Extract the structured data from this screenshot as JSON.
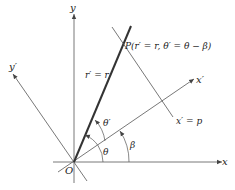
{
  "diagram": {
    "labels": {
      "x_axis": "x",
      "y_axis": "y",
      "x_prime_axis": "x′",
      "y_prime_axis": "y′",
      "origin": "O",
      "point_p": "P(r′ = r, θ′ = θ − β)",
      "radius_label": "r′ = r",
      "line_label": "x′ = p",
      "theta_prime": "θ′",
      "theta": "θ",
      "beta": "β"
    },
    "colors": {
      "axis": "#555555",
      "thick_line": "#333333",
      "text": "#222222"
    }
  }
}
